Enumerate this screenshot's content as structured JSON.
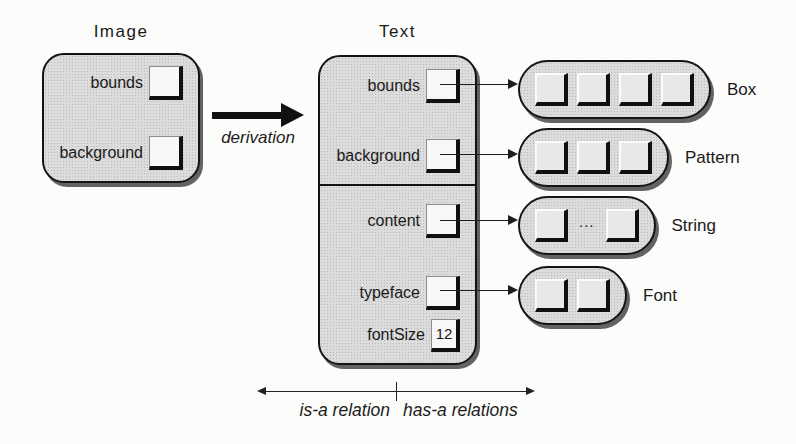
{
  "colors": {
    "box_fill": "#dcdcdc",
    "box_border": "#141414",
    "slot_fill": "#f7f7f7",
    "shadow": "#636363",
    "background": "#fcfcfb"
  },
  "image_class": {
    "title": "Image",
    "slots": [
      {
        "label": "bounds"
      },
      {
        "label": "background"
      }
    ]
  },
  "derivation": {
    "label": "derivation"
  },
  "text_class": {
    "title": "Text",
    "inherited_slots": [
      {
        "label": "bounds"
      },
      {
        "label": "background"
      }
    ],
    "own_slots": [
      {
        "label": "content"
      },
      {
        "label": "typeface"
      },
      {
        "label": "fontSize",
        "value": "12"
      }
    ]
  },
  "targets": [
    {
      "label": "Box",
      "squares": 4,
      "ellipsis": false,
      "ellipsis_text": ""
    },
    {
      "label": "Pattern",
      "squares": 3,
      "ellipsis": false,
      "ellipsis_text": ""
    },
    {
      "label": "String",
      "squares": 2,
      "ellipsis": true,
      "ellipsis_text": "..."
    },
    {
      "label": "Font",
      "squares": 2,
      "ellipsis": false,
      "ellipsis_text": ""
    }
  ],
  "legend": {
    "left": "is-a relation",
    "right": "has-a relations"
  }
}
